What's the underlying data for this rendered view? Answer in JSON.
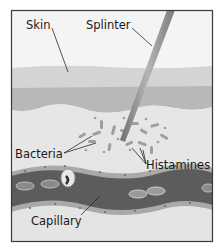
{
  "diagram": {
    "type": "anatomical-illustration",
    "labels": {
      "skin": "Skin",
      "splinter": "Splinter",
      "bacteria": "Bacteria",
      "histamines": "Histamines",
      "capillary": "Capillary"
    },
    "colors": {
      "frame": "#3a3a3a",
      "background": "#efefef",
      "skin_upper": "#d6d6d6",
      "skin_lower": "#b9b9b9",
      "tissue": "#e2e2e2",
      "capillary_wall": "#a8a8a8",
      "capillary_lumen": "#5a5a5a",
      "splinter": "#9a9a9a",
      "bacteria": "#a0a0a0"
    }
  }
}
